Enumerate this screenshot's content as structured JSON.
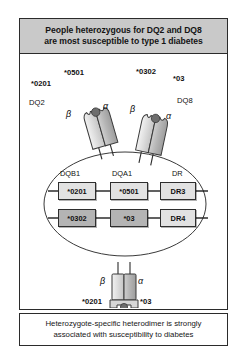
{
  "figure": {
    "header": {
      "line1": "People heterozygous for DQ2 and DQ8",
      "line2": "are most susceptible to type 1 diabetes"
    },
    "footer": {
      "line1": "Heterozygote-specific heterodimer is strongly",
      "line2": "associated with susceptibility to diabetes"
    }
  },
  "top_molecules": {
    "left": {
      "molecule_name": "DQ2",
      "beta_allele": "*0201",
      "alpha_allele": "*0501",
      "beta_chain": "β",
      "alpha_chain": "α"
    },
    "right": {
      "molecule_name": "DQ8",
      "beta_allele": "*0302",
      "alpha_allele": "*03",
      "beta_chain": "β",
      "alpha_chain": "α"
    }
  },
  "gene_map": {
    "columns": [
      "DQB1",
      "DQA1",
      "DR"
    ],
    "rows": [
      {
        "haplotype": "DQ2-haplotype",
        "cells": [
          {
            "label": "*0201",
            "shade": "light"
          },
          {
            "label": "*0501",
            "shade": "light"
          },
          {
            "label": "DR3",
            "shade": "light"
          }
        ]
      },
      {
        "haplotype": "DQ8-haplotype",
        "cells": [
          {
            "label": "*0302",
            "shade": "dark"
          },
          {
            "label": "*03",
            "shade": "dark"
          },
          {
            "label": "DR4",
            "shade": "light"
          }
        ]
      }
    ]
  },
  "bottom_molecule": {
    "beta_chain": "β",
    "alpha_chain": "α",
    "beta_allele": "*0201",
    "alpha_allele": "*03"
  },
  "colors": {
    "banner_fill": "#c9c9c9",
    "border": "#2b2b2b",
    "box_light": "#e2e2e2",
    "box_dark": "#b4b4b4",
    "chain_light": "#dcdcdc",
    "chain_dark": "#b0b0b0",
    "peptide_dot": "#6e6e6e"
  }
}
